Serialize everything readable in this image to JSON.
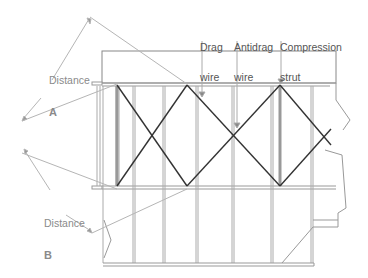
{
  "figure": {
    "type": "structural-diagram"
  },
  "labels": {
    "distance_a": {
      "line1": "Distance",
      "line2": "A"
    },
    "distance_b": {
      "line1": "Distance",
      "line2": "B"
    },
    "drag_wire": {
      "line1": "Drag",
      "line2": "wire"
    },
    "antidrag_wire": {
      "line1": "Antidrag",
      "line2": "wire"
    },
    "compression_strut": {
      "line1": "Compression",
      "line2": "strut"
    }
  },
  "colors": {
    "structure": "#888888",
    "wire": "#333333",
    "dimension": "#aaaaaa",
    "label_text": "#555555",
    "dimension_text": "#8a8a8a"
  }
}
